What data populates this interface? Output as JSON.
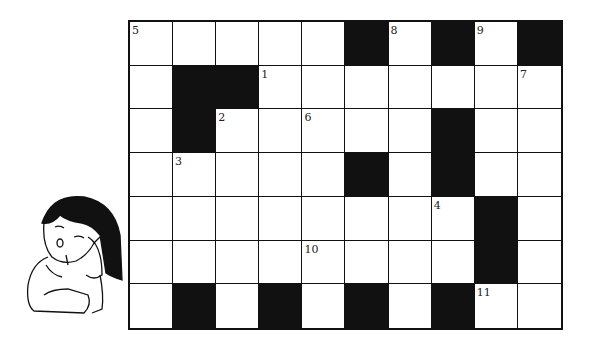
{
  "puzzle": {
    "type": "crossword",
    "rows": 7,
    "cols": 10,
    "black_cells": [
      [
        0,
        5
      ],
      [
        0,
        7
      ],
      [
        0,
        9
      ],
      [
        1,
        1
      ],
      [
        1,
        2
      ],
      [
        2,
        1
      ],
      [
        2,
        7
      ],
      [
        3,
        5
      ],
      [
        3,
        7
      ],
      [
        4,
        8
      ],
      [
        5,
        8
      ],
      [
        6,
        1
      ],
      [
        6,
        3
      ],
      [
        6,
        5
      ],
      [
        6,
        7
      ]
    ],
    "numbers": [
      {
        "row": 0,
        "col": 0,
        "label": "5"
      },
      {
        "row": 0,
        "col": 6,
        "label": "8"
      },
      {
        "row": 0,
        "col": 8,
        "label": "9"
      },
      {
        "row": 1,
        "col": 3,
        "label": "1"
      },
      {
        "row": 1,
        "col": 9,
        "label": "7"
      },
      {
        "row": 2,
        "col": 2,
        "label": "2"
      },
      {
        "row": 2,
        "col": 4,
        "label": "6"
      },
      {
        "row": 3,
        "col": 1,
        "label": "3"
      },
      {
        "row": 4,
        "col": 7,
        "label": "4"
      },
      {
        "row": 5,
        "col": 4,
        "label": "10"
      },
      {
        "row": 6,
        "col": 8,
        "label": "11"
      }
    ],
    "colors": {
      "ink": "#111111",
      "paper": "#ffffff"
    }
  },
  "illustration": {
    "subject": "thinking-girl-icon"
  }
}
